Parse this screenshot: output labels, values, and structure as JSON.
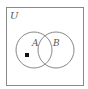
{
  "diagram": {
    "type": "venn",
    "universe_label": "U",
    "sets": [
      {
        "label": "A",
        "cx": 34,
        "cy": 50,
        "r": 18
      },
      {
        "label": "B",
        "cx": 56,
        "cy": 50,
        "r": 18
      }
    ],
    "marker": {
      "shape": "square",
      "region": "A only",
      "x": 27,
      "y": 56
    },
    "colors": {
      "stroke": "#888888",
      "marker": "#111111"
    }
  }
}
